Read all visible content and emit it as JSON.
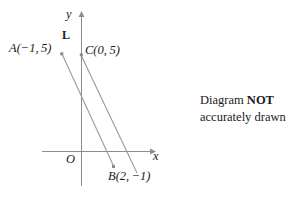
{
  "diagram": {
    "axes": {
      "x_label": "x",
      "y_label": "y",
      "origin_label": "O",
      "x_axis_color": "#8c8c8c",
      "y_axis_color": "#8c8c8c"
    },
    "line_label": "L",
    "line_color": "#9a9a9a",
    "point_color": "#8a8a8a",
    "points": [
      {
        "id": "A",
        "label": "A(−1, 5)",
        "x": -1,
        "y": 5
      },
      {
        "id": "C",
        "label": "C(0, 5)",
        "x": 0,
        "y": 5
      },
      {
        "id": "B",
        "label": "B(2, −1)",
        "x": 2,
        "y": -1
      }
    ],
    "segments": [
      {
        "name": "segment-AB",
        "from": "A",
        "to": "B"
      },
      {
        "name": "line-L",
        "from": "C",
        "to": "beyond-B"
      }
    ]
  },
  "note": {
    "line1_prefix": "Diagram ",
    "line1_strong": "NOT",
    "line2": "accurately drawn"
  }
}
